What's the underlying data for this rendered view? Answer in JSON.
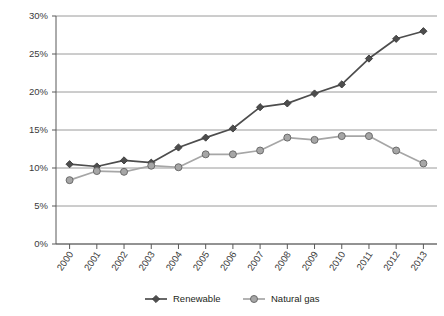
{
  "chart_data": {
    "type": "line",
    "title": "",
    "subtitle": "",
    "xlabel": "",
    "ylabel": "",
    "categories": [
      "2000",
      "2001",
      "2002",
      "2003",
      "2004",
      "2005",
      "2006",
      "2007",
      "2008",
      "2009",
      "2010",
      "2011",
      "2012",
      "2013"
    ],
    "series": [
      {
        "name": "Renewable",
        "marker": "diamond",
        "color": "#4d4d4d",
        "values": [
          10.5,
          10.2,
          11.0,
          10.7,
          12.7,
          14.0,
          15.2,
          18.0,
          18.5,
          19.8,
          21.0,
          24.4,
          27.0,
          28.0
        ]
      },
      {
        "name": "Natural gas",
        "marker": "circle",
        "color": "#a6a6a6",
        "values": [
          8.4,
          9.6,
          9.5,
          10.3,
          10.1,
          11.8,
          11.8,
          12.3,
          14.0,
          13.7,
          14.2,
          14.2,
          12.3,
          10.6
        ]
      }
    ],
    "ylim": [
      0,
      30
    ],
    "ytick_values": [
      0,
      5,
      10,
      15,
      20,
      25,
      30
    ],
    "ytick_labels": [
      "0%",
      "5%",
      "10%",
      "15%",
      "20%",
      "25%",
      "30%"
    ],
    "grid": "horizontal",
    "legend_position": "bottom",
    "legend_entries": [
      "Renewable",
      "Natural gas"
    ]
  },
  "legend": {
    "items": [
      {
        "label": "Renewable"
      },
      {
        "label": "Natural gas"
      }
    ]
  }
}
